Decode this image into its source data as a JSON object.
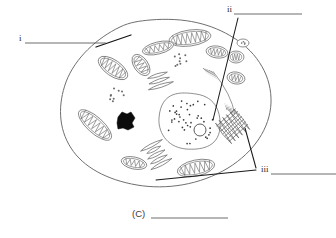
{
  "figure": {
    "type": "biology-diagram",
    "caption_label": "(C)",
    "caption_blank": true
  },
  "labels": {
    "i": {
      "text": "i",
      "x": 19,
      "y": 41,
      "answer_line": {
        "x1": 25,
        "y1": 43,
        "x2": 106,
        "y2": 43
      },
      "pointer": {
        "x1": 96,
        "y1": 47,
        "x2": 131,
        "y2": 35
      },
      "points_to": "cell-membrane"
    },
    "ii": {
      "text": "ii",
      "x": 227,
      "y": 12,
      "answer_line": {
        "x1": 234,
        "y1": 14,
        "x2": 302,
        "y2": 14
      },
      "pointer": {
        "x1": 238,
        "y1": 18,
        "x2": 213,
        "y2": 120
      },
      "points_to": "nucleus"
    },
    "iii": {
      "text": "iii",
      "x": 261,
      "y": 172,
      "answer_line": {
        "x1": 271,
        "y1": 174,
        "x2": 336,
        "y2": 174
      },
      "pointer_a": {
        "x1": 256,
        "y1": 168,
        "x2": 245,
        "y2": 128
      },
      "pointer_b": {
        "x1": 256,
        "y1": 170,
        "x2": 156,
        "y2": 180
      },
      "points_to": "golgi-and-mitochondrion"
    }
  },
  "caption": {
    "prefix": "(C)",
    "prefix_x": 132,
    "prefix_y": 217,
    "line": {
      "x1": 151,
      "y1": 218,
      "x2": 228,
      "y2": 218
    }
  },
  "cell": {
    "membrane_path": "M 150 20 C 185 17 212 24 234 38 C 258 53 272 77 271 103 C 270 128 254 152 228 168 C 200 185 166 190 137 185 C 107 180 83 167 71 148 C 58 128 58 104 66 82 C 75 58 97 38 120 27 C 130 22 140 21 150 20 Z",
    "organelles": {
      "mitochondria": [
        {
          "cx": 190,
          "cy": 38,
          "rx": 21,
          "ry": 8,
          "rot": -8,
          "cristae": 7
        },
        {
          "cx": 158,
          "cy": 48,
          "rx": 16,
          "ry": 6,
          "rot": -14,
          "cristae": 5
        },
        {
          "cx": 217,
          "cy": 52,
          "rx": 11,
          "ry": 6,
          "rot": 8,
          "cristae": 4
        },
        {
          "cx": 236,
          "cy": 57,
          "rx": 8,
          "ry": 6,
          "rot": 0,
          "cristae": 3
        },
        {
          "cx": 236,
          "cy": 78,
          "rx": 9,
          "ry": 6,
          "rot": 10,
          "cristae": 3
        },
        {
          "cx": 113,
          "cy": 68,
          "rx": 17,
          "ry": 8,
          "rot": 35,
          "cristae": 6
        },
        {
          "cx": 141,
          "cy": 65,
          "rx": 12,
          "ry": 7,
          "rot": 55,
          "cristae": 4
        },
        {
          "cx": 95,
          "cy": 125,
          "rx": 21,
          "ry": 8,
          "rot": 42,
          "cristae": 7
        },
        {
          "cx": 134,
          "cy": 163,
          "rx": 13,
          "ry": 6,
          "rot": 12,
          "cristae": 4
        },
        {
          "cx": 196,
          "cy": 168,
          "rx": 19,
          "ry": 8,
          "rot": -12,
          "cristae": 6
        }
      ],
      "nucleus": {
        "cx": 190,
        "cy": 122,
        "rx": 31,
        "ry": 28,
        "chromatin_dots": 46,
        "nucleolus": {
          "cx": 200,
          "cy": 130,
          "r": 6
        }
      },
      "rough_er": [
        {
          "cx": 225,
          "cy": 90,
          "arcs": 6
        },
        {
          "cx": 160,
          "cy": 83,
          "tubules": 3
        },
        {
          "cx": 155,
          "cy": 152,
          "tubules": 5
        }
      ],
      "golgi": {
        "cx": 233,
        "cy": 126,
        "stacks": 6
      },
      "ribosome_clusters": [
        {
          "cx": 182,
          "cy": 60,
          "count": 9
        },
        {
          "cx": 118,
          "cy": 95,
          "count": 9
        }
      ],
      "dense_granule": {
        "cx": 126,
        "cy": 121,
        "r": 9
      },
      "vesicles": [
        {
          "cx": 243,
          "cy": 43,
          "r": 4
        }
      ]
    }
  },
  "colors": {
    "background": "#ffffff",
    "ink": "#1a1a1a",
    "organelle_stroke": "#6b6b6b",
    "membrane_stroke": "#6f6f6f",
    "answer_line": "#5b5b5b",
    "dense_granule": "#0b0b0b"
  }
}
